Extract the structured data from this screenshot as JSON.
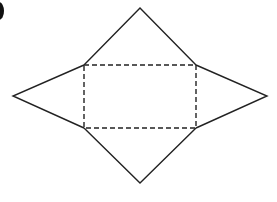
{
  "diagram": {
    "type": "net-of-rectangular-pyramid",
    "stroke_color": "#222222",
    "background_color": "#ffffff",
    "base_rectangle": {
      "style": "dashed",
      "x1": 84,
      "y1": 65,
      "x2": 196,
      "y2": 128
    },
    "triangles": [
      {
        "name": "top",
        "apex": [
          140,
          8
        ]
      },
      {
        "name": "bottom",
        "apex": [
          140,
          183
        ]
      },
      {
        "name": "left",
        "apex": [
          13,
          96
        ]
      },
      {
        "name": "right",
        "apex": [
          267,
          96
        ]
      }
    ],
    "clipped_marker": "partial label glyph at top-left edge"
  }
}
